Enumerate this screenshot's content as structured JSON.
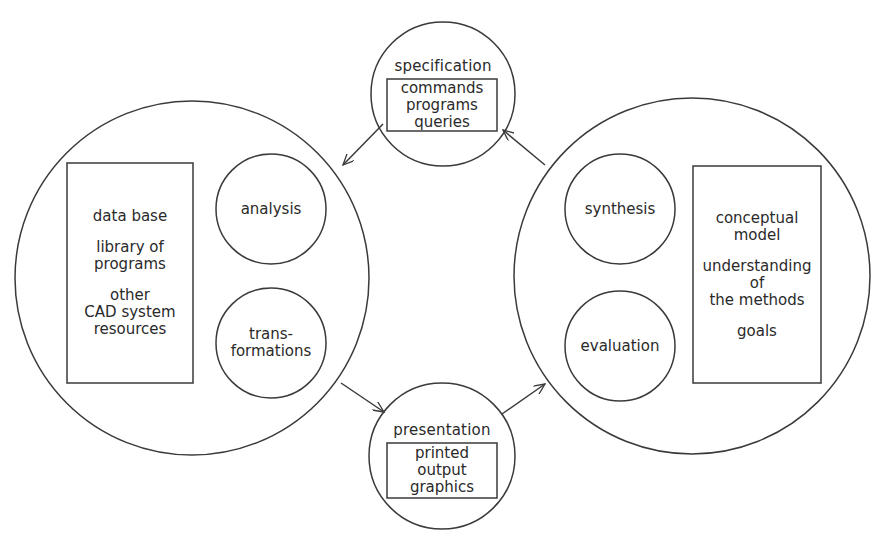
{
  "diagram": {
    "type": "cycle-diagram",
    "stroke_color": "#3a3a3a",
    "left_domain": {
      "label": "CAD system",
      "resources_box": {
        "lines": [
          "data base",
          "library of",
          "programs",
          "other",
          "CAD system",
          "resources"
        ],
        "groups": [
          [
            "data base"
          ],
          [
            "library of",
            "programs"
          ],
          [
            "other",
            "CAD system",
            "resources"
          ]
        ]
      },
      "processes": [
        {
          "id": "analysis",
          "lines": [
            "analysis"
          ]
        },
        {
          "id": "transformations",
          "lines": [
            "trans-",
            "formations"
          ]
        }
      ]
    },
    "right_domain": {
      "label": "designer",
      "knowledge_box": {
        "groups": [
          [
            "conceptual",
            "model"
          ],
          [
            "understanding",
            "of",
            "the methods"
          ],
          [
            "goals"
          ]
        ]
      },
      "processes": [
        {
          "id": "synthesis",
          "lines": [
            "synthesis"
          ]
        },
        {
          "id": "evaluation",
          "lines": [
            "evaluation"
          ]
        }
      ]
    },
    "top_node": {
      "title": "specification",
      "box_lines": [
        "commands",
        "programs",
        "queries"
      ]
    },
    "bottom_node": {
      "title": "presentation",
      "box_lines": [
        "printed",
        "output",
        "graphics"
      ]
    },
    "arrows": [
      {
        "from": "specification",
        "to": "left_domain"
      },
      {
        "from": "left_domain",
        "to": "presentation"
      },
      {
        "from": "presentation",
        "to": "right_domain"
      },
      {
        "from": "right_domain",
        "to": "specification"
      }
    ]
  }
}
